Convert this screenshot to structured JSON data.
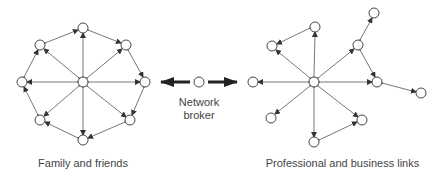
{
  "labels": {
    "left_network": "Family and friends",
    "right_network": "Professional and business links",
    "broker_line1": "Network",
    "broker_line2": "broker"
  },
  "colors": {
    "line": "#444444",
    "node_stroke": "#333333",
    "broker_arrow": "#222222",
    "text": "#444444"
  },
  "diagram": {
    "left_network": {
      "name": "Family and friends",
      "hub": [
        83,
        82
      ],
      "nodes": [
        [
          83,
          28
        ],
        [
          126,
          45
        ],
        [
          145,
          82
        ],
        [
          130,
          120
        ],
        [
          83,
          140
        ],
        [
          40,
          120
        ],
        [
          22,
          82
        ],
        [
          40,
          45
        ]
      ],
      "edges": "hub to every node, plus ring connecting adjacent nodes (all bidirectional)"
    },
    "right_network": {
      "name": "Professional and business links",
      "hub": [
        314,
        82
      ],
      "nodes": [
        [
          315,
          27
        ],
        [
          272,
          46
        ],
        [
          253,
          82
        ],
        [
          271,
          118
        ],
        [
          314,
          142
        ],
        [
          362,
          120
        ],
        [
          358,
          45
        ],
        [
          377,
          82
        ]
      ],
      "extra_nodes": [
        [
          374,
          13
        ],
        [
          421,
          93
        ]
      ]
    },
    "broker": {
      "name": "Network broker",
      "position": [
        199,
        82
      ]
    }
  }
}
